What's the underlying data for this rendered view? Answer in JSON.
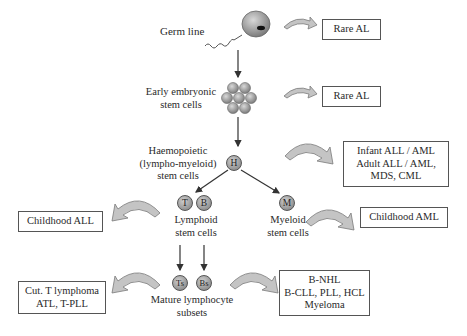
{
  "stages": {
    "germ_line": "Germ line",
    "early_embryonic": [
      "Early embryonic",
      "stem cells"
    ],
    "haemopoietic": [
      "Haemopoietic",
      "(lympho-myeloid)",
      "stem cells"
    ],
    "lymphoid": [
      "Lymphoid",
      "stem cells"
    ],
    "myeloid": [
      "Myeloid",
      "stem cells"
    ],
    "mature": [
      "Mature lymphocyte",
      "subsets"
    ]
  },
  "cells": {
    "haemopoietic": "H",
    "t_cell": "T",
    "b_cell": "B",
    "myeloid": "M",
    "ts_cell": "Ts",
    "bs_cell": "Bs"
  },
  "outcomes": {
    "germ_line": [
      "Rare AL"
    ],
    "early_embryonic": [
      "Rare AL"
    ],
    "haemopoietic": [
      "Infant ALL / AML",
      "Adult ALL / AML,",
      "MDS, CML"
    ],
    "lymphoid": [
      "Childhood ALL"
    ],
    "myeloid": [
      "Childhood AML"
    ],
    "mature_t": [
      "Cut. T lymphoma",
      "ATL, T-PLL"
    ],
    "mature_b": [
      "B-NHL",
      "B-CLL, PLL, HCL",
      "Myeloma"
    ]
  },
  "colors": {
    "arrow_fill": "#c4c4c4",
    "arrow_stroke": "#7a7a7a",
    "line": "#333333",
    "box_border": "#555555"
  }
}
